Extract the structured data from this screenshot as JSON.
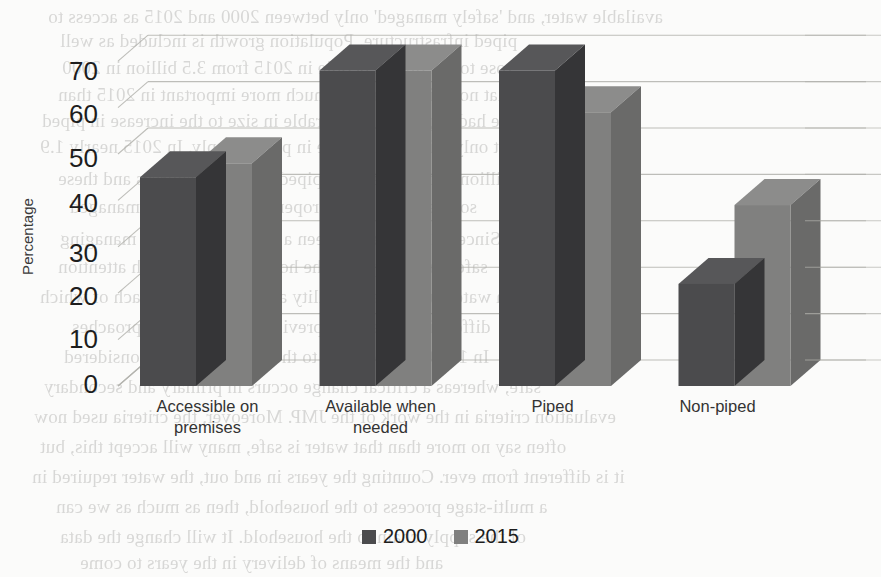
{
  "chart_data": {
    "type": "bar",
    "title": "",
    "subtitle": "",
    "xlabel": "",
    "ylabel": "Percentage",
    "ylim": [
      0,
      75
    ],
    "yticks": [
      0,
      10,
      20,
      30,
      40,
      50,
      60,
      70
    ],
    "grid": true,
    "legend_position": "bottom",
    "style": "3d-clustered-column",
    "categories": [
      "Accessible on premises",
      "Available when needed",
      "Piped",
      "Non-piped"
    ],
    "series": [
      {
        "name": "2000",
        "color": "#4b4b4d",
        "values": [
          45,
          68,
          68,
          22
        ]
      },
      {
        "name": "2015",
        "color": "#80807f",
        "values": [
          48,
          68,
          59,
          39
        ]
      }
    ]
  },
  "axis": {
    "y_title": "Percentage",
    "y_tick_labels": [
      "70",
      "60",
      "50",
      "40",
      "30",
      "20",
      "10",
      "0"
    ],
    "x_tick_labels": [
      [
        "Accessible on",
        "premises"
      ],
      [
        "Available when",
        "needed"
      ],
      [
        "Piped",
        ""
      ],
      [
        "Non-piped",
        ""
      ]
    ]
  },
  "legend": {
    "items": [
      {
        "label": "2000",
        "color": "#4b4b4d"
      },
      {
        "label": "2015",
        "color": "#80807f"
      }
    ]
  },
  "colors": {
    "series_2000": "#4b4b4d",
    "series_2000_side": "#39393b",
    "series_2000_top": "#565658",
    "series_2015": "#80807f",
    "series_2015_side": "#636362",
    "series_2015_top": "#8e8e8d",
    "gridline": "#b3b3ae",
    "background": "#fbfbfa",
    "text": "#1d1d1d"
  },
  "bleed_text": [
    {
      "t": "available water, and 'safely managed' only between 2000 and 2015 as access to",
      "x": 48,
      "y": 6
    },
    {
      "t": "piped infrastructure. Population growth is included as well",
      "x": 60,
      "y": 30
    },
    {
      "t": "rose to 5.2 billion people in 2015 from 3.5 billion in 2000",
      "x": 62,
      "y": 57
    },
    {
      "t": "that non-piped water is much more important in 2015 than",
      "x": 58,
      "y": 84
    },
    {
      "t": "we had expected, comparable in size to the increase in piped",
      "x": 42,
      "y": 110
    },
    {
      "t": "not only with the increase in piped supply. In 2015 nearly 1.9",
      "x": 40,
      "y": 136
    },
    {
      "t": "billion people used non-piped improved sources and these",
      "x": 58,
      "y": 168
    },
    {
      "t": "sources need to be properly monitored and managed",
      "x": 70,
      "y": 196
    },
    {
      "t": "Since 2015 there has been a renewed focus on managing",
      "x": 60,
      "y": 228
    },
    {
      "t": "safe water supply at the household level, with attention",
      "x": 58,
      "y": 256
    },
    {
      "t": "on water quality, availability and accessibility, each of which",
      "x": 40,
      "y": 286
    },
    {
      "t": "differs in scope from previous monitoring approaches",
      "x": 72,
      "y": 316
    },
    {
      "t": "In 1990 water carried to the household was considered",
      "x": 64,
      "y": 346
    },
    {
      "t": "safe, whereas a critical change occurs in primary and secondary",
      "x": 44,
      "y": 376
    },
    {
      "t": "evaluation criteria in the work of the JMP. Moreover, the criteria used now",
      "x": 34,
      "y": 406
    },
    {
      "t": "often say no more than that water is safe, many will accept this, but",
      "x": 40,
      "y": 436
    },
    {
      "t": "it is different from ever. Counting the years in and out, the water required in",
      "x": 32,
      "y": 466
    },
    {
      "t": "a multi-stage process to the household, then as much as we can",
      "x": 56,
      "y": 496
    },
    {
      "t": "of the supply chain to the household. It will change the data",
      "x": 60,
      "y": 526
    },
    {
      "t": "and the means of delivery in the years to come",
      "x": 80,
      "y": 552
    }
  ]
}
